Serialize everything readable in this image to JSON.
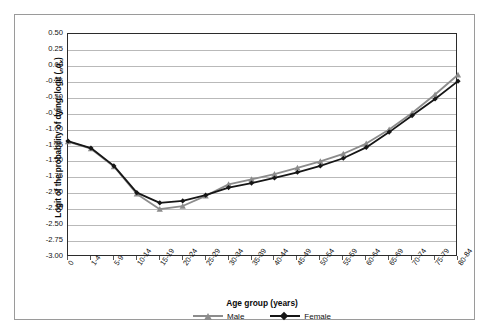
{
  "chart_data": {
    "type": "line",
    "title": "",
    "xlabel": "Age group (years)",
    "ylabel": "Logit of the probability of dying: logit (nqx)",
    "ylabel_parts": {
      "prefix": "Logit of the probability of dying: logit (",
      "sub_n": "n",
      "var_q": "q",
      "sub_x": "x",
      "suffix": ")"
    },
    "categories": [
      "0",
      "1-4",
      "5-9",
      "10-14",
      "15-19",
      "20-24",
      "25-29",
      "30-34",
      "35-39",
      "40-44",
      "45-49",
      "50-54",
      "55-59",
      "60-64",
      "65-69",
      "70-74",
      "75-79",
      "80-84"
    ],
    "ylim": [
      -3.0,
      0.5
    ],
    "yticks": [
      "0.50",
      "0.25",
      "0.00",
      "-0.25",
      "-0.50",
      "-0.75",
      "-1.00",
      "-1.25",
      "-1.50",
      "-1.75",
      "-2.00",
      "-2.25",
      "-2.50",
      "-2.75",
      "-3.00"
    ],
    "ytick_values": [
      0.5,
      0.25,
      0.0,
      -0.25,
      -0.5,
      -0.75,
      -1.0,
      -1.25,
      -1.5,
      -1.75,
      -2.0,
      -2.25,
      -2.5,
      -2.75,
      -3.0
    ],
    "grid": true,
    "legend_position": "bottom",
    "series": [
      {
        "name": "Male",
        "color": "#8c8c8c",
        "marker": "triangle",
        "values": [
          -1.19,
          -1.3,
          -1.58,
          -2.01,
          -2.25,
          -2.2,
          -2.04,
          -1.86,
          -1.78,
          -1.7,
          -1.6,
          -1.5,
          -1.38,
          -1.22,
          -1.0,
          -0.74,
          -0.45,
          -0.14
        ]
      },
      {
        "name": "Female",
        "color": "#161616",
        "marker": "diamond",
        "values": [
          -1.18,
          -1.29,
          -1.57,
          -1.99,
          -2.15,
          -2.12,
          -2.03,
          -1.91,
          -1.84,
          -1.76,
          -1.67,
          -1.57,
          -1.45,
          -1.28,
          -1.04,
          -0.78,
          -0.52,
          -0.24
        ]
      }
    ]
  },
  "legend": {
    "entries": [
      {
        "label": "Male"
      },
      {
        "label": "Female"
      }
    ]
  }
}
